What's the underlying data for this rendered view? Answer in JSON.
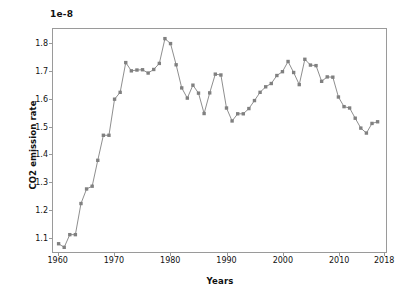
{
  "chart_data": {
    "type": "line",
    "title": "",
    "xlabel": "Years",
    "ylabel": "CO2 emission rate",
    "offset_label": "1e-8",
    "scale_factor": "1e-8",
    "xlim": [
      1959,
      2018.5
    ],
    "ylim": [
      1.045,
      1.855
    ],
    "xticks": [
      1960,
      1970,
      1980,
      1990,
      2000,
      2010,
      2018
    ],
    "xtick_labels": [
      "1960",
      "1970",
      "1980",
      "1990",
      "2000",
      "2010",
      "2018"
    ],
    "yticks": [
      1.1,
      1.2,
      1.3,
      1.4,
      1.5,
      1.6,
      1.7,
      1.8
    ],
    "ytick_labels": [
      "1.1",
      "1.2",
      "1.3",
      "1.4",
      "1.5",
      "1.6",
      "1.7",
      "1.8"
    ],
    "grid": false,
    "legend": null,
    "marker": "square",
    "marker_color": "#808080",
    "line_color": "#808080",
    "x": [
      1960,
      1961,
      1962,
      1963,
      1964,
      1965,
      1966,
      1967,
      1968,
      1969,
      1970,
      1971,
      1972,
      1973,
      1974,
      1975,
      1976,
      1977,
      1978,
      1979,
      1980,
      1981,
      1982,
      1983,
      1984,
      1985,
      1986,
      1987,
      1988,
      1989,
      1990,
      1991,
      1992,
      1993,
      1994,
      1995,
      1996,
      1997,
      1998,
      1999,
      2000,
      2001,
      2002,
      2003,
      2004,
      2005,
      2006,
      2007,
      2008,
      2009,
      2010,
      2011,
      2012,
      2013,
      2014,
      2015,
      2016,
      2017
    ],
    "y": [
      1.075,
      1.062,
      1.108,
      1.108,
      1.221,
      1.274,
      1.284,
      1.378,
      1.469,
      1.469,
      1.6,
      1.625,
      1.733,
      1.703,
      1.706,
      1.707,
      1.695,
      1.708,
      1.73,
      1.82,
      1.802,
      1.725,
      1.641,
      1.604,
      1.651,
      1.622,
      1.548,
      1.623,
      1.691,
      1.688,
      1.568,
      1.521,
      1.547,
      1.547,
      1.566,
      1.595,
      1.625,
      1.645,
      1.657,
      1.686,
      1.7,
      1.737,
      1.697,
      1.653,
      1.745,
      1.724,
      1.722,
      1.665,
      1.681,
      1.68,
      1.608,
      1.573,
      1.568,
      1.531,
      1.495,
      1.477,
      1.512,
      1.518
    ]
  }
}
